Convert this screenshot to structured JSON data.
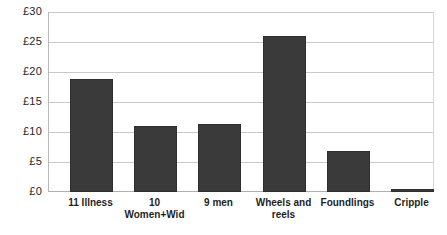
{
  "chart_data": {
    "type": "bar",
    "title": "",
    "subtitle": "",
    "xlabel": "",
    "ylabel": "",
    "categories": [
      "11 Illness",
      "10 Women+Wid",
      "9 men",
      "Wheels and reels",
      "Foundlings",
      "Cripple"
    ],
    "values": [
      18.8,
      11.0,
      11.3,
      26.0,
      6.8,
      0.5
    ],
    "ylim": [
      0,
      30
    ],
    "ytick_values": [
      0,
      5,
      10,
      15,
      20,
      25,
      30
    ],
    "ytick_labels": [
      "£0",
      "£5",
      "£10",
      "£15",
      "£20",
      "£25",
      "£30"
    ],
    "currency_symbol": "£",
    "grid": true,
    "grid_axis": "y",
    "legend": false,
    "legend_position": "none",
    "series": [
      {
        "name": "",
        "values": [
          18.8,
          11.0,
          11.3,
          26.0,
          6.8,
          0.5
        ],
        "color": "#3a3a3a"
      }
    ],
    "annotations": []
  },
  "style": {
    "bar_color": "#3a3a3a",
    "bar_border_color": "#2e2e2e",
    "gridline_color": "#c9c9c9",
    "axis_color": "#b9b9b9",
    "background": "#ffffff",
    "text_color": "#1f1f1f"
  }
}
